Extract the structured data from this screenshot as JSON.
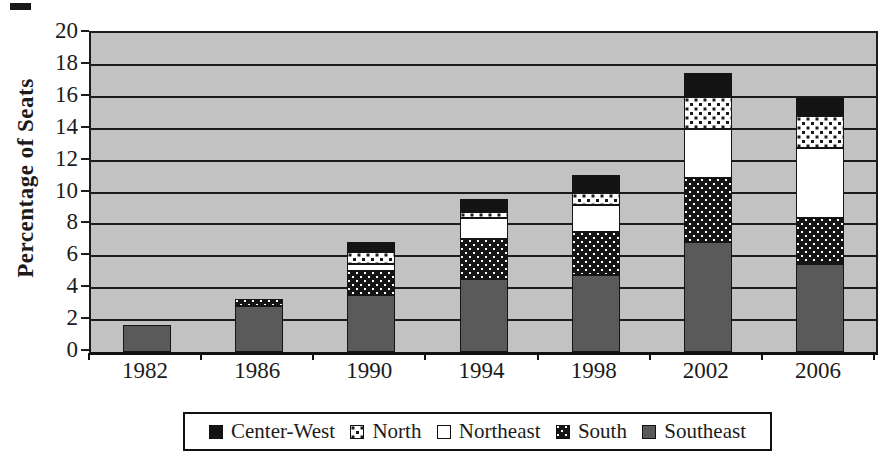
{
  "figure": {
    "kind": "scanned stacked bar chart",
    "colors": {
      "plot_background": "#c2c2c2",
      "ink": "#1b1b1b",
      "southeast_fill": "#5a5a5a",
      "centerwest_fill": "#131313",
      "northeast_fill": "#ffffff"
    }
  },
  "chart_data": {
    "type": "bar",
    "stacked": true,
    "title": "",
    "xlabel": "",
    "ylabel": "Percentage of Seats",
    "ylim": [
      0,
      20
    ],
    "ytick_step": 2,
    "yticks": [
      0,
      2,
      4,
      6,
      8,
      10,
      12,
      14,
      16,
      18,
      20
    ],
    "grid": "horizontal",
    "categories": [
      "1982",
      "1986",
      "1990",
      "1994",
      "1998",
      "2002",
      "2006"
    ],
    "series": [
      {
        "name": "Southeast",
        "pattern": "solid-darkgray",
        "values": [
          1.7,
          2.9,
          3.6,
          4.6,
          4.8,
          6.9,
          5.5
        ]
      },
      {
        "name": "South",
        "pattern": "white-dots-on-black",
        "values": [
          0,
          0.4,
          1.5,
          2.5,
          2.7,
          4.0,
          2.9
        ]
      },
      {
        "name": "Northeast",
        "pattern": "plain-white",
        "values": [
          0,
          0,
          0.45,
          1.3,
          1.7,
          3.1,
          4.4
        ]
      },
      {
        "name": "North",
        "pattern": "black-dots-on-white",
        "values": [
          0,
          0,
          0.75,
          0.4,
          0.8,
          2.0,
          2.0
        ]
      },
      {
        "name": "Center-West",
        "pattern": "solid-black",
        "values": [
          0,
          0,
          0.6,
          0.8,
          1.1,
          1.5,
          1.1
        ]
      }
    ],
    "totals": [
      1.7,
      3.3,
      6.9,
      9.6,
      11.1,
      17.5,
      15.9
    ],
    "legend": {
      "position": "bottom",
      "order": [
        "Center-West",
        "North",
        "Northeast",
        "South",
        "Southeast"
      ]
    }
  }
}
